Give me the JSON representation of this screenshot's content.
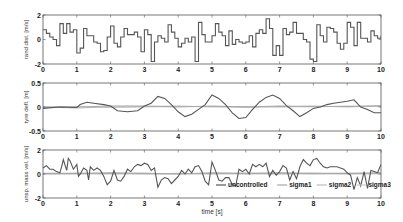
{
  "chart_data": [
    {
      "type": "line",
      "title": "",
      "xlabel": "",
      "ylabel": "rand dist. [m/s]",
      "xlim": [
        0,
        10
      ],
      "ylim": [
        -2,
        2
      ],
      "xticks": [
        "0",
        "1",
        "2",
        "3",
        "4",
        "5",
        "6",
        "7",
        "8",
        "9",
        "10"
      ],
      "yticks": [
        "-2",
        "0",
        "2"
      ],
      "grid": false,
      "series": [
        {
          "name": "disturbance",
          "style": "step",
          "color": "#555555",
          "x": [
            0,
            0.1,
            0.2,
            0.3,
            0.4,
            0.5,
            0.6,
            0.7,
            0.8,
            0.9,
            1.0,
            1.1,
            1.2,
            1.3,
            1.4,
            1.5,
            1.6,
            1.7,
            1.8,
            1.9,
            2.0,
            2.1,
            2.2,
            2.3,
            2.4,
            2.5,
            2.6,
            2.7,
            2.8,
            2.9,
            3.0,
            3.1,
            3.2,
            3.3,
            3.4,
            3.5,
            3.6,
            3.7,
            3.8,
            3.9,
            4.0,
            4.1,
            4.2,
            4.3,
            4.4,
            4.5,
            4.6,
            4.7,
            4.8,
            4.9,
            5.0,
            5.1,
            5.2,
            5.3,
            5.4,
            5.5,
            5.6,
            5.7,
            5.8,
            5.9,
            6.0,
            6.1,
            6.2,
            6.3,
            6.4,
            6.5,
            6.6,
            6.7,
            6.8,
            6.9,
            7.0,
            7.1,
            7.2,
            7.3,
            7.4,
            7.5,
            7.6,
            7.7,
            7.8,
            7.9,
            8.0,
            8.1,
            8.2,
            8.3,
            8.4,
            8.5,
            8.6,
            8.7,
            8.8,
            8.9,
            9.0,
            9.1,
            9.2,
            9.3,
            9.4,
            9.5,
            9.6,
            9.7,
            9.8,
            9.9,
            10.0
          ],
          "y": [
            0.8,
            0.5,
            0.2,
            0.0,
            -0.5,
            1.3,
            0.5,
            1.3,
            0.6,
            0.8,
            -1.1,
            -0.7,
            0.9,
            0.3,
            0.3,
            -0.2,
            -0.3,
            -1.0,
            -0.9,
            0.2,
            1.1,
            -0.3,
            -0.6,
            0.2,
            0.9,
            0.4,
            0.4,
            0.6,
            0.2,
            -1.0,
            0.8,
            0.4,
            -1.8,
            -0.2,
            0.3,
            0.1,
            -0.2,
            1.2,
            0.6,
            0.1,
            -0.6,
            -0.3,
            0.1,
            -0.2,
            0.2,
            -1.8,
            1.4,
            0.4,
            -0.2,
            -0.2,
            0.3,
            1.3,
            0.6,
            0.3,
            -0.5,
            0.7,
            -0.4,
            0.0,
            -0.2,
            -0.3,
            -0.2,
            0.3,
            -0.6,
            0.5,
            0.8,
            0.5,
            1.7,
            0.9,
            -1.3,
            -0.5,
            -1.3,
            0.9,
            0.4,
            0.6,
            1.4,
            0.5,
            0.5,
            0.0,
            -0.2,
            -1.6,
            -1.8,
            1.2,
            0.3,
            -0.2,
            1.0,
            0.9,
            0.6,
            -0.3,
            -0.8,
            -0.3,
            1.4,
            1.0,
            -0.5,
            1.4,
            0.1,
            0.1,
            -0.2,
            0.7,
            0.3,
            0.1,
            0.3
          ]
        }
      ]
    },
    {
      "type": "line",
      "title": "",
      "xlabel": "",
      "ylabel": "tyre defl. [m]",
      "xlim": [
        0,
        10
      ],
      "ylim": [
        -0.5,
        0.5
      ],
      "xticks": [
        "0",
        "1",
        "2",
        "3",
        "4",
        "5",
        "6",
        "7",
        "8",
        "9",
        "10"
      ],
      "yticks": [
        "-0.5",
        "0",
        "0.5"
      ],
      "grid": false,
      "series": [
        {
          "name": "uncontrolled",
          "color": "#555555",
          "x": [
            0,
            0.5,
            1.0,
            1.1,
            1.3,
            1.5,
            1.8,
            2.0,
            2.2,
            2.5,
            2.8,
            3.0,
            3.2,
            3.4,
            3.6,
            3.8,
            4.0,
            4.2,
            4.4,
            4.6,
            4.8,
            5.0,
            5.2,
            5.4,
            5.6,
            5.8,
            6.0,
            6.2,
            6.4,
            6.6,
            6.8,
            7.0,
            7.2,
            7.4,
            7.6,
            7.8,
            8.0,
            8.2,
            8.4,
            8.6,
            8.8,
            9.0,
            9.2,
            9.4,
            9.6,
            9.8,
            10.0
          ],
          "y": [
            -0.03,
            0.0,
            -0.01,
            0.05,
            0.1,
            0.08,
            0.05,
            0.02,
            -0.08,
            -0.1,
            -0.08,
            0.02,
            0.08,
            0.22,
            0.18,
            0.05,
            -0.1,
            -0.2,
            -0.15,
            -0.05,
            0.05,
            0.25,
            0.18,
            0.05,
            -0.12,
            -0.24,
            -0.22,
            -0.05,
            0.1,
            0.2,
            0.25,
            0.18,
            0.03,
            -0.08,
            -0.2,
            -0.12,
            -0.03,
            0.0,
            0.05,
            0.08,
            0.1,
            0.12,
            0.15,
            0.0,
            -0.05,
            -0.12,
            -0.12
          ]
        },
        {
          "name": "sigma1",
          "color": "#a8a8a8",
          "x": [
            0,
            1.0,
            2.0,
            3.0,
            4.0,
            5.0,
            6.0,
            7.0,
            8.0,
            9.0,
            10.0
          ],
          "y": [
            0.0,
            0.0,
            0.02,
            0.02,
            0.0,
            0.02,
            0.0,
            0.02,
            0.01,
            0.01,
            0.02
          ]
        },
        {
          "name": "sigma2",
          "color": "#bcbcbc",
          "x": [
            0,
            1.0,
            2.0,
            3.0,
            4.0,
            5.0,
            6.0,
            7.0,
            8.0,
            9.0,
            10.0
          ],
          "y": [
            0.0,
            -0.02,
            0.0,
            0.01,
            0.02,
            0.0,
            0.01,
            0.0,
            0.02,
            0.0,
            0.03
          ]
        },
        {
          "name": "sigma3",
          "color": "#cccccc",
          "x": [
            0,
            1.0,
            2.0,
            3.0,
            4.0,
            5.0,
            6.0,
            7.0,
            8.0,
            9.0,
            10.0
          ],
          "y": [
            0.0,
            0.01,
            -0.01,
            0.0,
            0.01,
            0.01,
            -0.01,
            0.01,
            0.0,
            0.02,
            0.01
          ]
        }
      ]
    },
    {
      "type": "line",
      "title": "",
      "xlabel": "time [s]",
      "ylabel": "unsp. mass vel. [m/s]",
      "xlim": [
        0,
        10
      ],
      "ylim": [
        -2,
        2
      ],
      "xticks": [
        "0",
        "1",
        "2",
        "3",
        "4",
        "5",
        "6",
        "7",
        "8",
        "9",
        "10"
      ],
      "yticks": [
        "-2",
        "0",
        "2"
      ],
      "grid": false,
      "legend": {
        "position": "lower center (inside)",
        "entries": [
          "uncontrolled",
          "sigma1",
          "sigma2",
          "sigma3"
        ]
      },
      "series": [
        {
          "name": "uncontrolled",
          "color": "#555555",
          "x": [
            0,
            0.1,
            0.2,
            0.3,
            0.4,
            0.5,
            0.55,
            0.6,
            0.7,
            0.75,
            0.8,
            0.9,
            1.0,
            1.05,
            1.1,
            1.2,
            1.3,
            1.35,
            1.4,
            1.5,
            1.6,
            1.7,
            1.8,
            1.9,
            2.0,
            2.1,
            2.2,
            2.3,
            2.4,
            2.5,
            2.6,
            2.7,
            2.8,
            2.9,
            3.0,
            3.1,
            3.2,
            3.3,
            3.4,
            3.5,
            3.6,
            3.7,
            3.8,
            3.9,
            4.0,
            4.1,
            4.2,
            4.3,
            4.4,
            4.5,
            4.6,
            4.7,
            4.8,
            4.9,
            5.0,
            5.1,
            5.2,
            5.3,
            5.4,
            5.5,
            5.6,
            5.7,
            5.8,
            5.9,
            6.0,
            6.1,
            6.2,
            6.3,
            6.4,
            6.5,
            6.6,
            6.7,
            6.8,
            6.9,
            7.0,
            7.1,
            7.2,
            7.3,
            7.4,
            7.5,
            7.6,
            7.7,
            7.8,
            7.9,
            8.0,
            8.1,
            8.2,
            8.3,
            8.4,
            8.5,
            8.6,
            8.7,
            8.8,
            8.9,
            9.0,
            9.1,
            9.2,
            9.3,
            9.4,
            9.5,
            9.6,
            9.7,
            9.8,
            9.9,
            10.0
          ],
          "y": [
            0.5,
            0.7,
            0.4,
            0.4,
            0.2,
            0.1,
            0.6,
            1.2,
            0.3,
            1.3,
            1.1,
            0.4,
            0.8,
            -0.2,
            0.0,
            0.5,
            0.3,
            -0.5,
            0.6,
            0.3,
            0.5,
            0.3,
            -0.2,
            -0.9,
            -0.6,
            0.3,
            -0.5,
            -0.6,
            -0.2,
            0.4,
            0.2,
            0.6,
            0.8,
            0.7,
            0.9,
            0.8,
            0.3,
            0.5,
            -1.1,
            -0.5,
            -0.3,
            -0.4,
            -0.8,
            -0.5,
            -0.2,
            0.3,
            0.0,
            0.4,
            0.1,
            0.6,
            0.7,
            0.2,
            -0.6,
            -0.9,
            1.0,
            0.3,
            -0.5,
            -0.6,
            -0.3,
            -0.3,
            -0.9,
            -1.0,
            0.4,
            0.2,
            0.4,
            0.0,
            0.8,
            0.6,
            0.8,
            0.6,
            0.9,
            -0.2,
            0.3,
            -0.1,
            0.2,
            0.7,
            0.5,
            -0.5,
            0.2,
            -0.4,
            0.6,
            1.2,
            0.9,
            0.7,
            1.2,
            1.3,
            0.9,
            0.6,
            0.5,
            0.6,
            0.6,
            0.6,
            0.5,
            0.4,
            0.1,
            -0.1,
            -1.3,
            -0.3,
            -1.0,
            0.2,
            -1.2,
            0.3,
            0.2,
            0.1,
            0.8
          ]
        },
        {
          "name": "sigma1",
          "color": "#a8a8a8",
          "x": [
            0,
            1.0,
            2.0,
            3.0,
            4.0,
            5.0,
            6.0,
            7.0,
            8.0,
            9.0,
            10.0
          ],
          "y": [
            0.05,
            0.05,
            0.1,
            0.05,
            0.0,
            0.1,
            0.05,
            0.1,
            0.05,
            0.05,
            0.1
          ]
        },
        {
          "name": "sigma2",
          "color": "#bcbcbc",
          "x": [
            0,
            1.0,
            2.0,
            3.0,
            4.0,
            5.0,
            6.0,
            7.0,
            8.0,
            9.0,
            10.0
          ],
          "y": [
            0.0,
            0.0,
            0.05,
            0.0,
            0.05,
            0.0,
            0.05,
            0.0,
            0.05,
            0.0,
            0.05
          ]
        },
        {
          "name": "sigma3",
          "color": "#cccccc",
          "x": [
            0,
            1.0,
            2.0,
            3.0,
            4.0,
            5.0,
            6.0,
            7.0,
            8.0,
            9.0,
            10.0
          ],
          "y": [
            0.0,
            0.05,
            0.0,
            0.05,
            0.0,
            0.05,
            0.0,
            0.05,
            0.0,
            0.05,
            0.0
          ]
        }
      ]
    }
  ],
  "layout": {
    "plots": [
      {
        "left": 43,
        "right": 381,
        "top": 15,
        "bottom": 64
      },
      {
        "left": 43,
        "right": 381,
        "top": 83,
        "bottom": 131
      },
      {
        "left": 43,
        "right": 381,
        "top": 150,
        "bottom": 198
      }
    ],
    "legend": {
      "y": 185,
      "x": 216
    },
    "axis_color": "#555555"
  }
}
